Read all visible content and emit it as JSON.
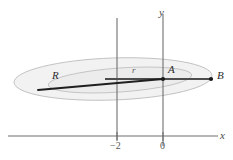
{
  "figure": {
    "background_color": "#ffffff",
    "axis_color": "#6b6b6b",
    "ellipse_stroke_color": "#b9b9b9",
    "ellipse_fill_color": "#ededed",
    "orbit_line_color": "#262626",
    "point_color": "#1a1a1a"
  },
  "axes": {
    "x_label": "x",
    "y_label": "y",
    "x_axis_y_px": 136,
    "y_axis_x_px": 163,
    "ticks": [
      {
        "label": "−2",
        "x_px": 117
      },
      {
        "label": "0",
        "x_px": 163
      }
    ]
  },
  "points": [
    {
      "name": "R",
      "label": "R",
      "x_px": 38,
      "y_px": 90,
      "dot": false
    },
    {
      "name": "A",
      "label": "A",
      "x_px": 163,
      "y_px": 79,
      "dot": true
    },
    {
      "name": "B",
      "label": "B",
      "x_px": 212,
      "y_px": 79,
      "dot": true
    }
  ],
  "segments": [
    {
      "name": "radius",
      "label": "r",
      "from": "center",
      "to": "A"
    },
    {
      "name": "semi-major-left",
      "label": "",
      "from": "R",
      "to": "A"
    },
    {
      "name": "apsis-right",
      "label": "",
      "from": "A",
      "to": "B"
    }
  ],
  "labels": {
    "R": "R",
    "A": "A",
    "B": "B",
    "r": "r",
    "x": "x",
    "y": "y",
    "tick_minus_two": "−2",
    "tick_zero": "0"
  },
  "ellipses": {
    "outer": {
      "cx": 113,
      "cy": 79,
      "rx": 99,
      "ry": 21,
      "rotation_deg": -2
    },
    "inner": {
      "cx": 120,
      "cy": 80,
      "rx": 72,
      "ry": 12,
      "rotation_deg": -4
    }
  }
}
